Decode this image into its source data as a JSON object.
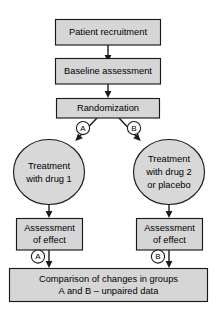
{
  "diagram": {
    "type": "flowchart",
    "colors": {
      "node_fill": "#d6d6d6",
      "ellipse_fill": "#d8d8d8",
      "stroke": "#1a1a1a",
      "marker_fill": "#ffffff",
      "background": "#ffffff"
    },
    "nodes": {
      "patient_recruitment": {
        "label": "Patient recruitment",
        "shape": "rectangle"
      },
      "baseline_assessment": {
        "label": "Baseline assessment",
        "shape": "rectangle"
      },
      "randomization": {
        "label": "Randomization",
        "shape": "rectangle"
      },
      "treatment_a": {
        "label_line1": "Treatment",
        "label_line2": "with drug 1",
        "shape": "ellipse"
      },
      "treatment_b": {
        "label_line1": "Treatment",
        "label_line2": "with drug 2",
        "label_line3": "or placebo",
        "shape": "ellipse"
      },
      "assessment_a": {
        "label_line1": "Assessment",
        "label_line2": "of effect",
        "shape": "rectangle"
      },
      "assessment_b": {
        "label_line1": "Assessment",
        "label_line2": "of effect",
        "shape": "rectangle"
      },
      "comparison": {
        "label_line1": "Comparison of changes in groups",
        "label_line2": "A and B – unpaired data",
        "shape": "rectangle"
      }
    },
    "markers": {
      "branch_a": "A",
      "branch_b": "B",
      "result_a": "A",
      "result_b": "B"
    }
  }
}
